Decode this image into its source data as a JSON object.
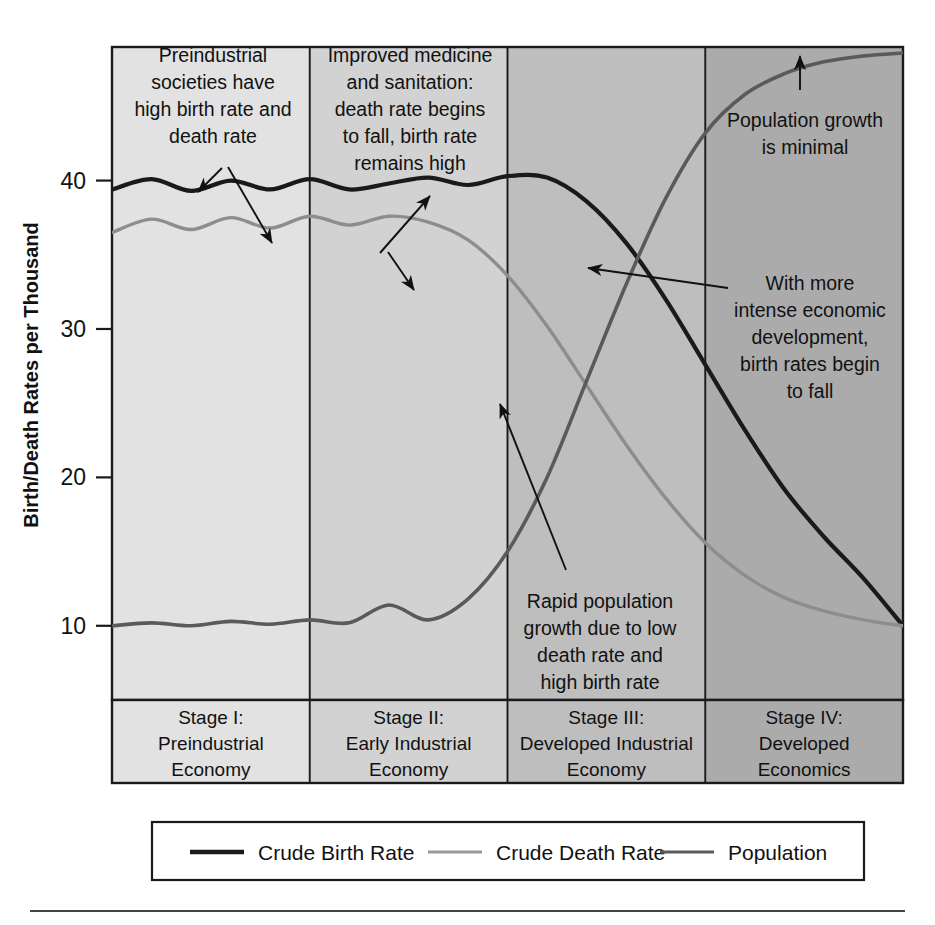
{
  "chart_data": {
    "type": "line",
    "title": "",
    "xlabel": "",
    "ylabel": "Birth/Death Rates per Thousand",
    "ylim": [
      5,
      49
    ],
    "yticks": [
      10,
      20,
      30,
      40
    ],
    "ytick_labels": [
      "10",
      "20",
      "30",
      "40"
    ],
    "grid": false,
    "legend_position": "bottom",
    "x": [
      0,
      5,
      10,
      15,
      20,
      25,
      30,
      35,
      40,
      45,
      50,
      55,
      60,
      65,
      70,
      75,
      80,
      85,
      90,
      95,
      100
    ],
    "series": [
      {
        "name": "Crude Birth Rate",
        "color": "#1a1a1a",
        "width": 4.2,
        "values": [
          39.4,
          40.1,
          39.3,
          40.0,
          39.4,
          40.1,
          39.4,
          39.8,
          40.2,
          39.7,
          40.3,
          40.2,
          38.6,
          35.8,
          32.0,
          27.6,
          23.2,
          19.2,
          16.0,
          13.2,
          10.0
        ]
      },
      {
        "name": "Crude Death Rate",
        "color": "#8d8d8d",
        "width": 3.4,
        "values": [
          36.5,
          37.4,
          36.7,
          37.5,
          36.8,
          37.6,
          37.0,
          37.6,
          37.2,
          36.0,
          33.6,
          30.2,
          26.2,
          22.2,
          18.6,
          15.6,
          13.4,
          11.9,
          11.0,
          10.4,
          10.0
        ]
      },
      {
        "name": "Population",
        "color": "#5a5a5a",
        "width": 3.6,
        "values": [
          10.0,
          10.2,
          10.0,
          10.3,
          10.1,
          10.4,
          10.2,
          11.4,
          10.4,
          11.8,
          15.0,
          20.0,
          26.5,
          33.0,
          38.8,
          43.2,
          45.8,
          47.2,
          48.0,
          48.4,
          48.6
        ]
      }
    ],
    "stages": [
      {
        "id": "I",
        "label_lines": [
          "Stage I:",
          "Preindustrial",
          "Economy"
        ],
        "fill": "#e2e2e2"
      },
      {
        "id": "II",
        "label_lines": [
          "Stage II:",
          "Early Industrial",
          "Economy"
        ],
        "fill": "#d2d2d2"
      },
      {
        "id": "III",
        "label_lines": [
          "Stage III:",
          "Developed Industrial",
          "Economy"
        ],
        "fill": "#bebebe"
      },
      {
        "id": "IV",
        "label_lines": [
          "Stage IV:",
          "Developed",
          "Economics"
        ],
        "fill": "#ababab"
      }
    ],
    "annotations": [
      {
        "id": "stage1-note",
        "lines": [
          "Preindustrial",
          "societies have",
          "high birth rate and",
          "death rate"
        ],
        "x": 213,
        "y": 62
      },
      {
        "id": "stage2-note",
        "lines": [
          "Improved medicine",
          "and sanitation:",
          "death rate begins",
          "to fall, birth rate",
          "remains high"
        ],
        "x": 410,
        "y": 62
      },
      {
        "id": "stage4-note",
        "lines": [
          "Population growth",
          "is minimal"
        ],
        "x": 805,
        "y": 127
      },
      {
        "id": "birthfall-note",
        "lines": [
          "With more",
          "intense economic",
          "development,",
          "birth rates begin",
          "to fall"
        ],
        "x": 810,
        "y": 290
      },
      {
        "id": "rapidgrowth-note",
        "lines": [
          "Rapid population",
          "growth due to low",
          "death rate and",
          "high birth rate"
        ],
        "x": 600,
        "y": 608
      }
    ]
  },
  "legend": {
    "entries": [
      {
        "label": "Crude Birth Rate",
        "color": "#1a1a1a",
        "width": 4.5
      },
      {
        "label": "Crude Death Rate",
        "color": "#9a9a9a",
        "width": 3.2
      },
      {
        "label": "Population",
        "color": "#5a5a5a",
        "width": 3.2
      }
    ]
  }
}
